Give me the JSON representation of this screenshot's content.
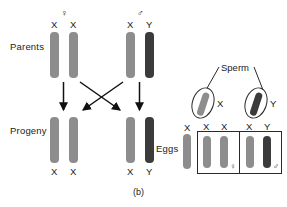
{
  "figure": {
    "caption": "(b)",
    "row_labels": {
      "parents": "Parents",
      "progeny": "Progeny",
      "eggs": "Eggs"
    },
    "sperm_label": "Sperm",
    "symbols": {
      "female": "♀",
      "male": "♂"
    }
  },
  "cross": {
    "parents": [
      {
        "sex": "female",
        "sex_symbol": "♀",
        "alleles": [
          "X",
          "X"
        ],
        "chromosomes": [
          {
            "label": "X",
            "type": "x",
            "color": "#8d8d8d"
          },
          {
            "label": "X",
            "type": "x",
            "color": "#8d8d8d"
          }
        ]
      },
      {
        "sex": "male",
        "sex_symbol": "♂",
        "alleles": [
          "X",
          "Y"
        ],
        "chromosomes": [
          {
            "label": "X",
            "type": "x",
            "color": "#8d8d8d"
          },
          {
            "label": "Y",
            "type": "y",
            "color": "#3b3b3b"
          }
        ]
      }
    ],
    "progeny": [
      {
        "sex": "female",
        "alleles": [
          "X",
          "X"
        ],
        "chromosomes": [
          {
            "label": "X",
            "type": "x",
            "color": "#8d8d8d"
          },
          {
            "label": "X",
            "type": "x",
            "color": "#8d8d8d"
          }
        ]
      },
      {
        "sex": "male",
        "alleles": [
          "X",
          "Y"
        ],
        "chromosomes": [
          {
            "label": "X",
            "type": "x",
            "color": "#8d8d8d"
          },
          {
            "label": "Y",
            "type": "y",
            "color": "#3b3b3b"
          }
        ]
      }
    ]
  },
  "punnett": {
    "egg": {
      "label": "X",
      "type": "x",
      "color": "#8d8d8d"
    },
    "sperm": [
      {
        "label": "X",
        "type": "x",
        "color": "#8d8d8d"
      },
      {
        "label": "Y",
        "type": "y",
        "color": "#3b3b3b"
      }
    ],
    "cells": [
      {
        "alleles": [
          "X",
          "X"
        ],
        "sex_symbol": "♀",
        "chromosomes": [
          {
            "label": "X",
            "type": "x",
            "color": "#8d8d8d"
          },
          {
            "label": "X",
            "type": "x",
            "color": "#8d8d8d"
          }
        ]
      },
      {
        "alleles": [
          "X",
          "Y"
        ],
        "sex_symbol": "♂",
        "chromosomes": [
          {
            "label": "X",
            "type": "x",
            "color": "#8d8d8d"
          },
          {
            "label": "Y",
            "type": "y",
            "color": "#3b3b3b"
          }
        ]
      }
    ]
  },
  "colors": {
    "x_chromosome": "#8d8d8d",
    "y_chromosome": "#3b3b3b",
    "ink": "#1a1a1a",
    "background": "#ffffff"
  }
}
